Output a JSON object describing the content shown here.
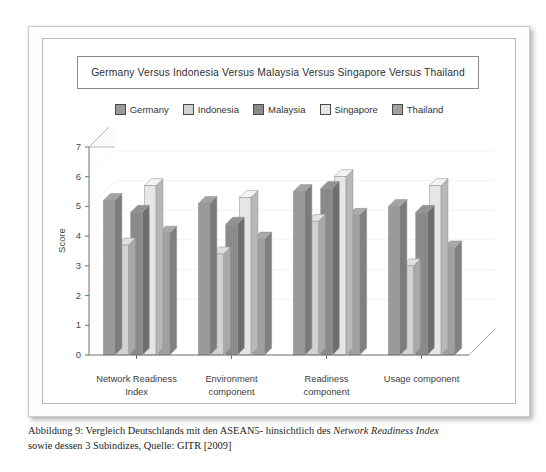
{
  "page": {
    "caption_line1_a": "Abbildung 9: Vergleich Deutschlands mit den ASEAN5- hinsichtlich des ",
    "caption_line1_italic": "Network Readiness Index",
    "caption_line2": "sowie dessen 3 Subindizes, Quelle: GITR [2009]"
  },
  "colors": {
    "germany": "#9a9a9a",
    "indonesia": "#d2d2d2",
    "malaysia": "#8a8a8a",
    "singapore": "#e6e6e6",
    "thailand": "#a0a0a0",
    "frame": "#b8b8b8",
    "axis": "#777777",
    "text": "#333333"
  },
  "chart_data": {
    "type": "bar",
    "title": "Germany Versus Indonesia Versus Malaysia Versus Singapore Versus Thailand",
    "xlabel": "",
    "ylabel": "Score",
    "ylim": [
      0,
      7
    ],
    "yticks": [
      0,
      1,
      2,
      3,
      4,
      5,
      6,
      7
    ],
    "grid": true,
    "legend_position": "top",
    "three_d": true,
    "categories": [
      "Network Readiness Index",
      "Environment component",
      "Readiness component",
      "Usage component"
    ],
    "category_lines": [
      [
        "Network Readiness",
        "Index"
      ],
      [
        "Environment",
        "component"
      ],
      [
        "Readiness",
        "component"
      ],
      [
        "Usage component",
        ""
      ]
    ],
    "series": [
      {
        "name": "Germany",
        "color": "#9a9a9a",
        "values": [
          5.2,
          5.1,
          5.5,
          5.0
        ]
      },
      {
        "name": "Indonesia",
        "color": "#d2d2d2",
        "values": [
          3.7,
          3.4,
          4.5,
          3.0
        ]
      },
      {
        "name": "Malaysia",
        "color": "#8a8a8a",
        "values": [
          4.8,
          4.4,
          5.6,
          4.8
        ]
      },
      {
        "name": "Singapore",
        "color": "#e6e6e6",
        "values": [
          5.7,
          5.3,
          6.0,
          5.7
        ]
      },
      {
        "name": "Thailand",
        "color": "#a0a0a0",
        "values": [
          4.1,
          3.9,
          4.7,
          3.6
        ]
      }
    ]
  }
}
